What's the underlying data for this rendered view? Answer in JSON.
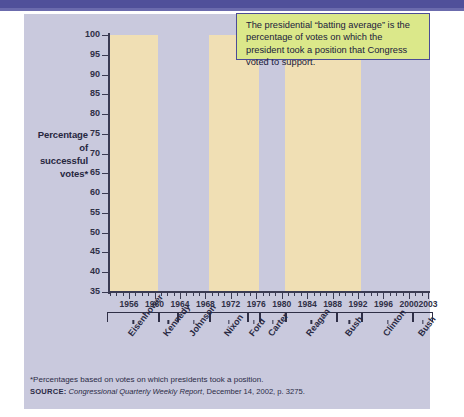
{
  "header": {
    "band_color": "#50509a"
  },
  "panel": {
    "bg_color": "#c9c9dd",
    "band_color": "#f0dfb4"
  },
  "callout": {
    "text": "The presidential “batting average” is the percentage of votes on which the president took a position that Congress voted to  support.",
    "bg_color": "#dbe88a",
    "border_color": "#4b4b96"
  },
  "axis_title": "Percentage of successful votes*",
  "axis_title_lines": [
    "Percentage",
    "of",
    "successful",
    "votes*"
  ],
  "footnote": "*Percentages based on votes on which presidents took a position.",
  "source": {
    "label": "SOURCE:",
    "publication": "Congressional Quarterly Weekly Report",
    "rest": ", December 14, 2002, p. 3275."
  },
  "presidents": [
    {
      "name": "Eisenhower",
      "start": 1953,
      "end": 1960,
      "shaded": true
    },
    {
      "name": "Kennedy",
      "start": 1961,
      "end": 1963,
      "shaded": false
    },
    {
      "name": "Johnson",
      "start": 1964,
      "end": 1968,
      "shaded": false
    },
    {
      "name": "Nixon",
      "start": 1969,
      "end": 1974,
      "shaded": true
    },
    {
      "name": "Ford",
      "start": 1975,
      "end": 1976,
      "shaded": true
    },
    {
      "name": "Carter",
      "start": 1977,
      "end": 1980,
      "shaded": false
    },
    {
      "name": "Reagan",
      "start": 1981,
      "end": 1988,
      "shaded": true
    },
    {
      "name": "Bush",
      "start": 1989,
      "end": 1992,
      "shaded": true
    },
    {
      "name": "Clinton",
      "start": 1993,
      "end": 2000,
      "shaded": false
    },
    {
      "name": "Bush",
      "start": 2001,
      "end": 2003,
      "shaded": false
    }
  ],
  "chart_data": {
    "type": "line",
    "title": "",
    "xlabel": "",
    "ylabel": "Percentage of successful votes*",
    "xlim": [
      1953,
      2003
    ],
    "ylim": [
      35,
      100
    ],
    "ytick_values": [
      35,
      40,
      45,
      50,
      55,
      60,
      65,
      70,
      75,
      80,
      85,
      90,
      95,
      100
    ],
    "xtick_values": [
      1956,
      1960,
      1964,
      1968,
      1972,
      1976,
      1980,
      1984,
      1988,
      1992,
      1996,
      2000,
      2003
    ],
    "xtick_labels": [
      "1956",
      "1960",
      "1964",
      "1968",
      "1972",
      "1976",
      "1980",
      "1984",
      "1988",
      "1992",
      "1996",
      "2000",
      "2003"
    ],
    "grid": false,
    "legend": "none",
    "line_color": "#d42a21",
    "series": [
      {
        "name": "Presidential batting average",
        "x": [
          1953,
          1954,
          1955,
          1956,
          1957,
          1958,
          1959,
          1960,
          1961,
          1962,
          1963,
          1964,
          1965,
          1966,
          1967,
          1968,
          1969,
          1970,
          1971,
          1972,
          1973,
          1974,
          1975,
          1976,
          1977,
          1978,
          1979,
          1980,
          1981,
          1982,
          1983,
          1984,
          1985,
          1986,
          1987,
          1988,
          1989,
          1990,
          1991,
          1992,
          1993,
          1994,
          1995,
          1996,
          1997,
          1998,
          1999,
          2000,
          2001,
          2002,
          2003
        ],
        "values": [
          89,
          83,
          75,
          70,
          68,
          76,
          52,
          65,
          81,
          85,
          87,
          88,
          93,
          79,
          79,
          75,
          74,
          77,
          75,
          66,
          51,
          60,
          61,
          54,
          75,
          78,
          77,
          75,
          82,
          72,
          67,
          66,
          60,
          56,
          44,
          47,
          63,
          47,
          54,
          43,
          86,
          86,
          37,
          55,
          54,
          51,
          38,
          55,
          87,
          88,
          79
        ]
      }
    ]
  }
}
